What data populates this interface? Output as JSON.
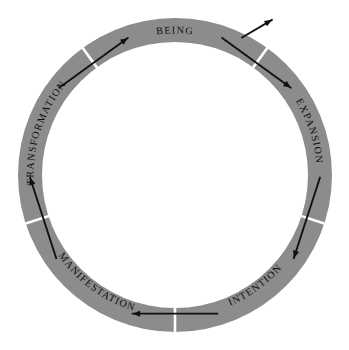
{
  "diagram": {
    "type": "cycle-ring",
    "shape": "annulus",
    "direction": "clockwise",
    "center": {
      "x": 175,
      "y": 175
    },
    "outer_radius": 157,
    "inner_radius": 133,
    "colors": {
      "band": "#8c8c8c",
      "background": "#ffffff",
      "arrow": "#111111",
      "divider": "#ffffff",
      "label": "#0d0d0d"
    },
    "segment_count": 5,
    "stages": [
      {
        "label": "BEING",
        "mid_angle": -90,
        "start_angle": -126,
        "end_angle": -54,
        "orientation": "upright",
        "text_rotation": 0,
        "flip": false
      },
      {
        "label": "EXPANSION",
        "mid_angle": -18,
        "start_angle": -54,
        "end_angle": 18,
        "orientation": "rotated-clockwise",
        "text_rotation": 72,
        "flip": false
      },
      {
        "label": "INTENTION",
        "mid_angle": 54,
        "start_angle": 18,
        "end_angle": 90,
        "orientation": "inverted",
        "text_rotation": 144,
        "flip": true
      },
      {
        "label": "MANIFESTATION",
        "mid_angle": 126,
        "start_angle": 90,
        "end_angle": 162,
        "orientation": "inverted",
        "text_rotation": 216,
        "flip": true
      },
      {
        "label": "TRANSFORMATION",
        "mid_angle": 198,
        "start_angle": 162,
        "end_angle": 234,
        "orientation": "rotated-counter-clockwise",
        "text_rotation": 288,
        "flip": false
      }
    ],
    "dividers": [
      {
        "name": "divider-being-expansion",
        "angle": -54
      },
      {
        "name": "divider-expansion-intention",
        "angle": 18
      },
      {
        "name": "divider-intention-manifestation",
        "angle": 90
      },
      {
        "name": "divider-manifestation-transformation",
        "angle": 162
      },
      {
        "name": "divider-transformation-being",
        "angle": 234
      }
    ],
    "flow_arrows": [
      {
        "name": "flow-arrow-being-to-expansion",
        "angle": -54,
        "span": 17,
        "direction": "clockwise"
      },
      {
        "name": "flow-arrow-expansion-to-intention",
        "angle": 18,
        "span": 17,
        "direction": "clockwise"
      },
      {
        "name": "flow-arrow-intention-to-manifestation",
        "angle": 90,
        "span": 17,
        "direction": "clockwise"
      },
      {
        "name": "flow-arrow-manifestation-to-transformation",
        "angle": 162,
        "span": 17,
        "direction": "clockwise"
      },
      {
        "name": "flow-arrow-transformation-to-being",
        "angle": 234,
        "span": 17,
        "direction": "clockwise"
      }
    ],
    "outward_arrow": {
      "name": "outward-arrow-expansion",
      "angle": -64,
      "inner_offset": 4,
      "outer_offset": 26,
      "direction": "outward"
    }
  }
}
